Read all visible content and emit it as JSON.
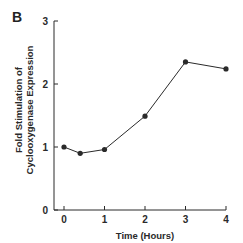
{
  "panel_label": "B",
  "chart_data": {
    "type": "line",
    "title": "",
    "xlabel": "Time (Hours)",
    "ylabel": "Fold Stimulation of Cyclooxygenase Expression",
    "ylabel_lines": [
      "Fold Stimulation of",
      "Cyclooxygenase Expression"
    ],
    "x": [
      0,
      0.4,
      1,
      2,
      3,
      4
    ],
    "values": [
      1.0,
      0.9,
      0.96,
      1.49,
      2.35,
      2.24
    ],
    "xlim": [
      0,
      4
    ],
    "ylim": [
      0,
      3
    ],
    "x_ticks": [
      0,
      1,
      2,
      3,
      4
    ],
    "y_ticks": [
      0,
      1,
      2,
      3
    ],
    "grid": false,
    "legend": null,
    "marker": "filled-circle",
    "line_color": "#2a2a2a"
  }
}
